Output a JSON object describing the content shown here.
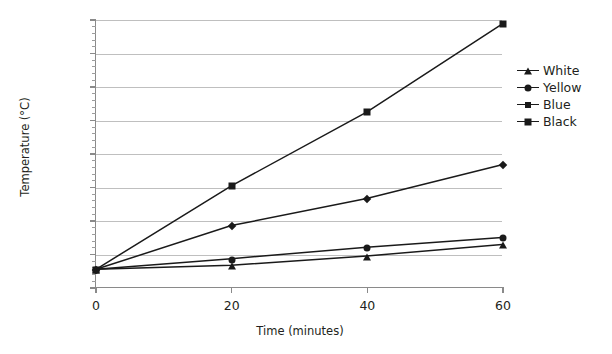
{
  "chart_data": {
    "type": "line",
    "title": "",
    "xlabel": "Time (minutes)",
    "ylabel": "Temperature (°C)",
    "x": [
      0,
      20,
      40,
      60
    ],
    "xlim": [
      0,
      60
    ],
    "ylim": [
      25,
      33
    ],
    "x_ticks": [
      "0",
      "20",
      "40",
      "60"
    ],
    "y_ticks": [
      "25",
      "26",
      "27",
      "28",
      "29",
      "30",
      "31",
      "32",
      "33"
    ],
    "y_minor_step": 0.2,
    "grid": "horizontal-only",
    "legend_position": "right",
    "series": [
      {
        "name": "White",
        "marker": "triangle",
        "color": "#1a1a1a",
        "values": [
          25.53,
          25.65,
          25.93,
          26.27
        ]
      },
      {
        "name": "Yellow",
        "marker": "circle",
        "color": "#1a1a1a",
        "values": [
          25.53,
          25.85,
          26.19,
          26.48
        ]
      },
      {
        "name": "Blue",
        "marker": "diamond",
        "color": "#1a1a1a",
        "values": [
          25.53,
          26.84,
          27.65,
          28.66
        ]
      },
      {
        "name": "Black",
        "marker": "square",
        "color": "#1a1a1a",
        "values": [
          25.53,
          28.03,
          30.24,
          32.88
        ]
      }
    ]
  },
  "legend": {
    "items": [
      {
        "label": "White"
      },
      {
        "label": "Yellow"
      },
      {
        "label": "Blue"
      },
      {
        "label": "Black"
      }
    ]
  },
  "colors": {
    "ink": "#231f20",
    "line": "#1a1a1a",
    "grid": "#bfbfbf",
    "axis": "#8a8a8a",
    "background": "#ffffff"
  }
}
